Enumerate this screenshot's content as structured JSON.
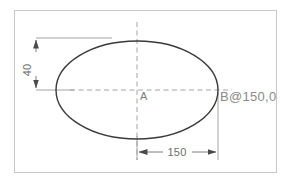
{
  "drawing": {
    "title": "Ellipse dimensioned technical drawing",
    "background_color": "#ffffff",
    "frame": {
      "name": "drawing-border",
      "color": "#c8c8c8",
      "x": 14,
      "y": 10,
      "width": 263,
      "height": 163
    },
    "shape": {
      "type": "ellipse",
      "name": "ellipse-outline",
      "color": "#3a3a3a",
      "center_x": 137,
      "center_y": 90,
      "radius_x": 81,
      "radius_y": 49
    },
    "centerlines": {
      "color": "#9a9a9a",
      "dash": "4,3",
      "vertical": {
        "x": 137,
        "y1": 22,
        "y2": 160
      },
      "horizontal": {
        "y": 90,
        "x1": 36,
        "x2": 232
      }
    },
    "extension_lines": {
      "color": "#9a9a9a",
      "top": {
        "x1": 36,
        "y": 38,
        "x2": 112
      },
      "middle": {
        "x1": 36,
        "y": 90,
        "x2": 72
      },
      "right": {
        "x": 218,
        "y1": 90,
        "y2": 160
      },
      "bottom_center": {
        "x": 137,
        "y1": 135,
        "y2": 160
      }
    },
    "dimensions": [
      {
        "name": "vertical-dimension-40",
        "value": "40",
        "orientation": "vertical",
        "rotated_deg": -90,
        "line_x": 36,
        "y_start": 38,
        "y_end": 90,
        "text_x": 31,
        "text_y": 68,
        "arrow_color": "#4a4a4a"
      },
      {
        "name": "horizontal-dimension-150",
        "value": "150",
        "orientation": "horizontal",
        "rotated_deg": 0,
        "line_y": 152,
        "x_start": 137,
        "x_end": 218,
        "text_x": 177,
        "text_y": 149,
        "arrow_color": "#4a4a4a"
      }
    ],
    "labels": [
      {
        "name": "center-point-label-a",
        "text": "A",
        "x": 140,
        "y": 99
      },
      {
        "name": "edge-point-label-b",
        "text": "B@150,0",
        "x": 221,
        "y": 100
      }
    ]
  }
}
